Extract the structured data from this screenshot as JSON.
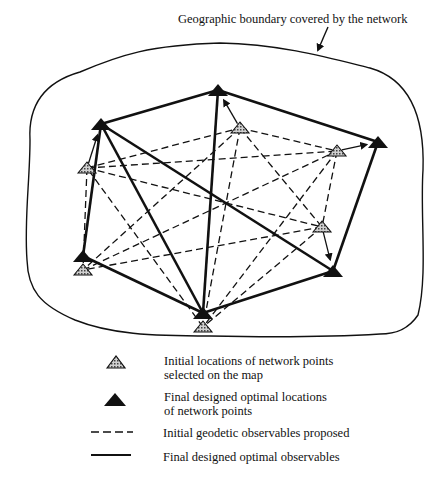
{
  "diagram": {
    "title": "Geographic boundary covered by the network",
    "colors": {
      "ink": "#111111",
      "hatch_fill": "#9a9a9a",
      "background": "#ffffff"
    },
    "final_points": [
      {
        "id": "A",
        "x": 101,
        "y": 124
      },
      {
        "id": "B",
        "x": 218,
        "y": 90
      },
      {
        "id": "C",
        "x": 378,
        "y": 142
      },
      {
        "id": "D",
        "x": 333,
        "y": 271
      },
      {
        "id": "E",
        "x": 203,
        "y": 313
      },
      {
        "id": "F",
        "x": 83,
        "y": 256
      }
    ],
    "initial_points": [
      {
        "id": "a",
        "x": 87,
        "y": 168
      },
      {
        "id": "b",
        "x": 240,
        "y": 128
      },
      {
        "id": "c",
        "x": 337,
        "y": 151
      },
      {
        "id": "d",
        "x": 322,
        "y": 227
      },
      {
        "id": "e",
        "x": 203,
        "y": 327
      },
      {
        "id": "f",
        "x": 83,
        "y": 270
      }
    ],
    "final_observables": [
      [
        "A",
        "B"
      ],
      [
        "B",
        "C"
      ],
      [
        "C",
        "D"
      ],
      [
        "D",
        "E"
      ],
      [
        "E",
        "F"
      ],
      [
        "F",
        "A"
      ],
      [
        "A",
        "E"
      ],
      [
        "A",
        "D"
      ],
      [
        "B",
        "E"
      ]
    ],
    "initial_observables": [
      [
        "a",
        "b"
      ],
      [
        "a",
        "c"
      ],
      [
        "a",
        "d"
      ],
      [
        "a",
        "f"
      ],
      [
        "b",
        "c"
      ],
      [
        "b",
        "d"
      ],
      [
        "b",
        "e"
      ],
      [
        "b",
        "f"
      ],
      [
        "c",
        "e"
      ],
      [
        "c",
        "d"
      ],
      [
        "d",
        "f"
      ],
      [
        "d",
        "e"
      ],
      [
        "e",
        "a"
      ],
      [
        "f",
        "c"
      ]
    ],
    "shifts": [
      [
        "a",
        "A"
      ],
      [
        "b",
        "B"
      ],
      [
        "c",
        "C"
      ],
      [
        "d",
        "D"
      ]
    ]
  },
  "legend": {
    "items": [
      {
        "symbol": "hatched-triangle",
        "line1": "Initial locations of network points",
        "line2": "selected on the map"
      },
      {
        "symbol": "solid-triangle",
        "line1": "Final designed optimal locations",
        "line2": "of network points"
      },
      {
        "symbol": "dashed-line",
        "line1": "Initial geodetic observables proposed",
        "line2": ""
      },
      {
        "symbol": "solid-line",
        "line1": "Final designed optimal observables",
        "line2": ""
      }
    ]
  }
}
